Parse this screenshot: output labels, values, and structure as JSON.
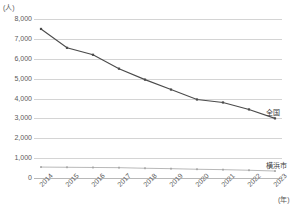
{
  "chart_data": {
    "type": "line",
    "title": "",
    "xlabel": "(年)",
    "ylabel": "(人)",
    "y_unit": "(人)",
    "x_unit": "(年)",
    "categories": [
      "2014",
      "2015",
      "2016",
      "2017",
      "2018",
      "2019",
      "2020",
      "2021",
      "2022",
      "2023"
    ],
    "ylim": [
      0,
      8000
    ],
    "ytick_labels": [
      "8,000",
      "7,000",
      "6,000",
      "5,000",
      "4,000",
      "3,000",
      "2,000",
      "1,000",
      "0"
    ],
    "ytick_values": [
      8000,
      7000,
      6000,
      5000,
      4000,
      3000,
      2000,
      1000,
      0
    ],
    "grid": true,
    "legend_position": "right-inline",
    "series": [
      {
        "name": "全国",
        "color": "#4a4a4a",
        "values": [
          7500,
          6550,
          6200,
          5500,
          4950,
          4450,
          3950,
          3800,
          3450,
          3000
        ]
      },
      {
        "name": "横浜市",
        "color": "#a6a6a6",
        "values": [
          550,
          540,
          530,
          520,
          490,
          470,
          440,
          420,
          390,
          350
        ]
      }
    ]
  }
}
